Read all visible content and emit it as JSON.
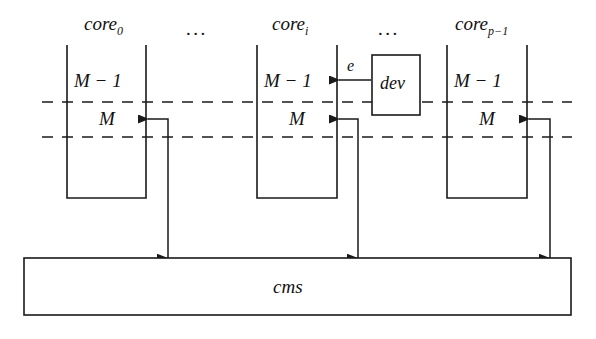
{
  "figure": {
    "background_color": "#ffffff",
    "stroke_color": "#1a1a1a"
  },
  "columns": [
    {
      "id": "core-0",
      "label_base": "core",
      "label_sub": "0",
      "label_full": "core0",
      "rows": [
        "M − 1",
        "M"
      ]
    },
    {
      "id": "core-i",
      "label_base": "core",
      "label_sub": "i",
      "label_full": "corei",
      "rows": [
        "M − 1",
        "M"
      ]
    },
    {
      "id": "core-p-1",
      "label_base": "core",
      "label_sub": "p−1",
      "label_full": "corep−1",
      "rows": [
        "M − 1",
        "M"
      ]
    }
  ],
  "ellipses": {
    "left": "...",
    "right": "..."
  },
  "device": {
    "label": "dev",
    "event_label": "e"
  },
  "shared": {
    "label": "cms"
  },
  "memory_rows": {
    "upper": "M − 1",
    "lower": "M"
  }
}
